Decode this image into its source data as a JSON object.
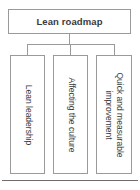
{
  "diagram": {
    "type": "hierarchy-tree",
    "orientation": "top-down",
    "root": {
      "label": "Lean roadmap",
      "text_orientation": "horizontal",
      "bold": true
    },
    "children": [
      {
        "label": "Lean leadership",
        "text_orientation": "vertical-rotated-90"
      },
      {
        "label": "Affecting the culture",
        "text_orientation": "vertical-rotated-90"
      },
      {
        "label": "Quick and measurable\nimprovement",
        "text_orientation": "vertical-rotated-90"
      }
    ],
    "colors": {
      "background": "#ffffff",
      "box_border": "#9a9a9a",
      "box_fill": "#ffffff",
      "connector": "#9a9a9a",
      "text": "#3a3a3a",
      "bottom_rule": "#6d6d6d"
    }
  }
}
